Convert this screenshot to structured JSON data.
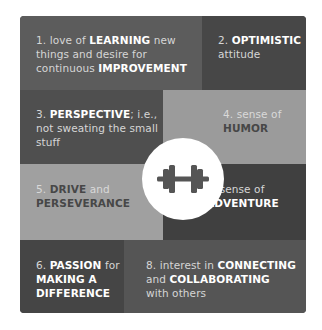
{
  "infographic": {
    "center_icon": "dumbbell-icon",
    "colors": {
      "background": "#ffffff",
      "dark_text_bold": "#ffffff",
      "light_text_bold": "#474747",
      "icon": "#555555"
    },
    "cells": [
      {
        "number": "1.",
        "parts": [
          {
            "t": " love of ",
            "b": false
          },
          {
            "t": "LEARNING",
            "b": true
          },
          {
            "t": " new things and desire for continuous ",
            "b": false
          },
          {
            "t": "IMPROVEMENT",
            "b": true
          }
        ]
      },
      {
        "number": "2.",
        "parts": [
          {
            "t": " ",
            "b": false
          },
          {
            "t": "OPTIMISTIC",
            "b": true
          },
          {
            "t": " attitude",
            "b": false
          }
        ]
      },
      {
        "number": "3.",
        "parts": [
          {
            "t": " ",
            "b": false
          },
          {
            "t": "PERSPECTIVE",
            "b": true
          },
          {
            "t": "; i.e., not sweating the small stuff",
            "b": false
          }
        ]
      },
      {
        "number": "4.",
        "parts": [
          {
            "t": " sense of ",
            "b": false
          },
          {
            "t": "HUMOR",
            "b": true
          }
        ]
      },
      {
        "number": "5.",
        "parts": [
          {
            "t": " ",
            "b": false
          },
          {
            "t": "DRIVE",
            "b": true
          },
          {
            "t": " and ",
            "b": false
          },
          {
            "t": "PERSEVERANCE",
            "b": true
          }
        ]
      },
      {
        "number": "6.",
        "parts": [
          {
            "t": " sense of ",
            "b": false
          },
          {
            "t": "ADVENTURE",
            "b": true
          }
        ]
      },
      {
        "number": "6.",
        "parts": [
          {
            "t": " ",
            "b": false
          },
          {
            "t": "PASSION",
            "b": true
          },
          {
            "t": " for ",
            "b": false
          },
          {
            "t": "MAKING A DIFFERENCE",
            "b": true
          }
        ]
      },
      {
        "number": "8.",
        "parts": [
          {
            "t": " interest in ",
            "b": false
          },
          {
            "t": "CONNECTING",
            "b": true
          },
          {
            "t": " and ",
            "b": false
          },
          {
            "t": "COLLABORATING",
            "b": true
          },
          {
            "t": " with others",
            "b": false
          }
        ]
      }
    ]
  }
}
